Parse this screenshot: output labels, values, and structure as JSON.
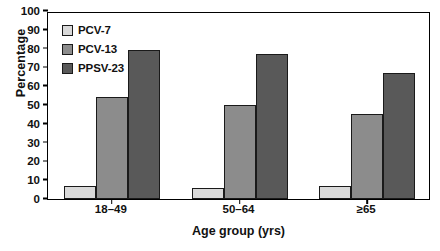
{
  "chart_data": {
    "type": "bar",
    "title": "",
    "subtitle": "",
    "xlabel": "Age group (yrs)",
    "ylabel": "Percentage",
    "categories": [
      "18–49",
      "50–64",
      "≥65"
    ],
    "series": [
      {
        "name": "PCV-7",
        "values": [
          7,
          6,
          7
        ],
        "color": "#d9d9d9"
      },
      {
        "name": "PCV-13",
        "values": [
          54,
          50,
          45
        ],
        "color": "#8c8c8c"
      },
      {
        "name": "PPSV-23",
        "values": [
          79,
          77,
          67
        ],
        "color": "#595959"
      }
    ],
    "ylim": [
      0,
      100
    ],
    "ytick_values": [
      0,
      10,
      20,
      30,
      40,
      50,
      60,
      70,
      80,
      90,
      100
    ],
    "ytick_labels": [
      "0",
      "10",
      "20",
      "30",
      "40",
      "50",
      "60",
      "70",
      "80",
      "90",
      "100"
    ],
    "grid": false,
    "legend_position": "inside-top-left",
    "bar_edge_color": "#1a1a1a",
    "axis_color": "#000000",
    "background": "#ffffff"
  }
}
